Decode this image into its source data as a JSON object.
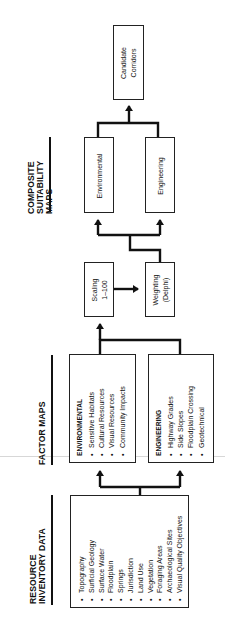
{
  "headers": {
    "composite": [
      "COMPOSITE",
      "SUITABILITY",
      "MAPS"
    ],
    "factor": [
      "FACTOR MAPS"
    ],
    "resource": [
      "RESOURCE",
      "INVENTORY DATA"
    ]
  },
  "candidate": {
    "label": [
      "Candidate",
      "Corridors"
    ]
  },
  "composite_maps": {
    "environmental": "Environmental",
    "engineering": "Engineering"
  },
  "scaling": {
    "label": [
      "Scaling",
      "1–100"
    ]
  },
  "weighting": {
    "label": [
      "Weighting",
      "(Delphi)"
    ]
  },
  "factor_maps": {
    "environmental": {
      "title": "ENVIRONMENTAL",
      "items": [
        "Sensitive Habitats",
        "Cultural Resources",
        "Visual Resources",
        "Community Impacts"
      ]
    },
    "engineering": {
      "title": "ENGINEERING",
      "items": [
        "Highway Grades",
        "Side Slopes",
        "Floodplain Crossing",
        "Geotechnical"
      ]
    }
  },
  "resource_inventory": {
    "items": [
      "Topography",
      "Surficial Geology",
      "Surface Water",
      "Floodplain",
      "Springs",
      "Jurisdiction",
      "Land Use",
      "Vegetation",
      "Foraging Areas",
      "Archaeological Sites",
      "Visual Quality Objectives"
    ]
  },
  "colors": {
    "ink": "#111111",
    "background": "#ffffff"
  }
}
